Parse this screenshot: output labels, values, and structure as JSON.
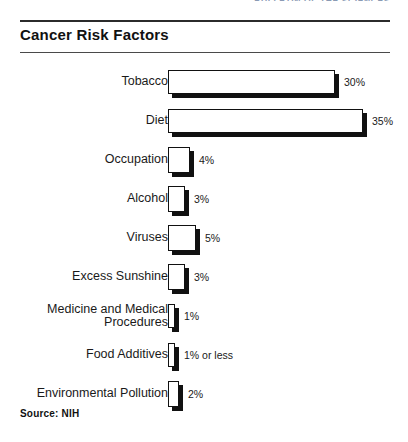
{
  "running_header": {
    "text": "BULLETIN OF THE SCIENCES"
  },
  "chart_data": {
    "type": "bar",
    "orientation": "horizontal",
    "title": "Cancer Risk Factors",
    "xlabel": "",
    "ylabel": "",
    "xlim": [
      0,
      35
    ],
    "grid": false,
    "legend": "none",
    "source": "Source: NIH",
    "categories": [
      "Tobacco",
      "Diet",
      "Occupation",
      "Alcohol",
      "Viruses",
      "Excess Sunshine",
      "Medicine and Medical\nProcedures",
      "Food Additives",
      "Environmental Pollution"
    ],
    "values": [
      30,
      35,
      4,
      3,
      5,
      3,
      1,
      1,
      2
    ],
    "value_labels": [
      "30%",
      "35%",
      "4%",
      "3%",
      "5%",
      "3%",
      "1%",
      "1% or less",
      "2%"
    ],
    "bar_style": {
      "fill": "#ffffff",
      "outline": "#111111",
      "shadow": "#111111"
    }
  }
}
